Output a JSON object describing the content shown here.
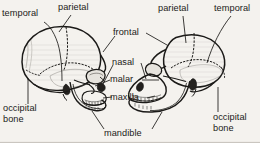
{
  "figure": {
    "background_color": "#f4f2ee",
    "ink_color": "#1b1a18",
    "shading_color": "#8d8a84"
  },
  "labels": {
    "left_temporal": "temporal",
    "left_parietal": "parietal",
    "left_occipital": "occipital\nbone",
    "center_frontal": "frontal",
    "center_nasal": "nasal",
    "center_malar": "malar",
    "center_maxilla": "maxilla",
    "center_mandible": "mandible",
    "right_parietal": "parietal",
    "right_temporal": "temporal",
    "right_occipital": "occipital\nbone"
  },
  "specimens": [
    {
      "name": "human-skull",
      "view": "lateral",
      "facing": "right",
      "bones_labeled": [
        "temporal",
        "parietal",
        "occipital bone",
        "frontal",
        "nasal",
        "malar",
        "maxilla",
        "mandible"
      ]
    },
    {
      "name": "ape-skull",
      "view": "lateral",
      "facing": "left",
      "bones_labeled": [
        "parietal",
        "temporal",
        "occipital bone",
        "frontal",
        "nasal",
        "malar",
        "maxilla",
        "mandible"
      ]
    }
  ]
}
